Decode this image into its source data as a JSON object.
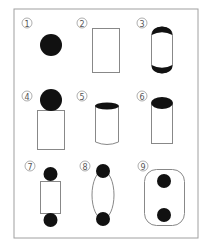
{
  "figure": {
    "frame": {
      "x": 14,
      "y": 9,
      "width": 184,
      "height": 229,
      "stroke": "#999999"
    },
    "colors": {
      "ink": "#111111",
      "line": "#888888",
      "label": "#555555"
    },
    "panels": [
      {
        "id": 1,
        "label": "①",
        "shape": "filled-circle"
      },
      {
        "id": 2,
        "label": "②",
        "shape": "rectangle-outline"
      },
      {
        "id": 3,
        "label": "③",
        "shape": "rounded-capsule-with-dark-caps"
      },
      {
        "id": 4,
        "label": "④",
        "shape": "circle-on-rectangle"
      },
      {
        "id": 5,
        "label": "⑤",
        "shape": "cylinder-dark-top"
      },
      {
        "id": 6,
        "label": "⑥",
        "shape": "cylinder-dark-top-short"
      },
      {
        "id": 7,
        "label": "⑦",
        "shape": "rectangle-between-two-circles"
      },
      {
        "id": 8,
        "label": "⑧",
        "shape": "ellipse-between-two-circles"
      },
      {
        "id": 9,
        "label": "⑨",
        "shape": "rounded-rect-containing-two-circles"
      }
    ]
  }
}
